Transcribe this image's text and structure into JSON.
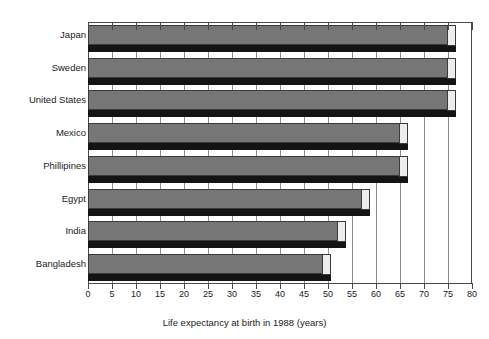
{
  "chart_data": {
    "type": "bar",
    "orientation": "horizontal",
    "title": "",
    "xlabel": "Life expectancy at birth in 1988 (years)",
    "ylabel": "",
    "categories": [
      "Japan",
      "Sweden",
      "United States",
      "Mexico",
      "Phillipines",
      "Egypt",
      "India",
      "Bangladesh"
    ],
    "values": [
      75,
      75,
      75,
      65,
      65,
      57,
      52,
      49
    ],
    "xlim": [
      0,
      80
    ],
    "xticks": [
      0,
      5,
      10,
      15,
      20,
      25,
      30,
      35,
      40,
      45,
      50,
      55,
      60,
      65,
      70,
      75,
      80
    ],
    "xtick_labels": [
      "0",
      "5",
      "10",
      "15",
      "20",
      "25",
      "30",
      "35",
      "40",
      "45",
      "50",
      "55",
      "60",
      "65",
      "70",
      "75",
      "80"
    ],
    "grid": "vertical",
    "legend": "none",
    "style": "3d-shadow-bars",
    "bar_fill_color": "#757575",
    "bar_shadow_color": "#141414",
    "bar_cap_color": "#ededed",
    "axis_color": "#4a4a4a",
    "grid_color": "#8d8d8d",
    "background_color": "#ffffff"
  },
  "axis": {
    "x_title": "Life expectancy at birth in 1988 (years)"
  },
  "header": {
    "cropped_caption": ""
  }
}
